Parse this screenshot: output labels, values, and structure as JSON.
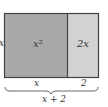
{
  "diagram": {
    "type": "area-model",
    "regions": [
      {
        "label": "x²",
        "fill": "#a9a9a9"
      },
      {
        "label": "2x",
        "fill": "#d2d2d2"
      }
    ],
    "side_label": "x",
    "bottom_labels": [
      "x",
      "2"
    ],
    "total_label": "x + 2",
    "stroke": "#444444"
  }
}
